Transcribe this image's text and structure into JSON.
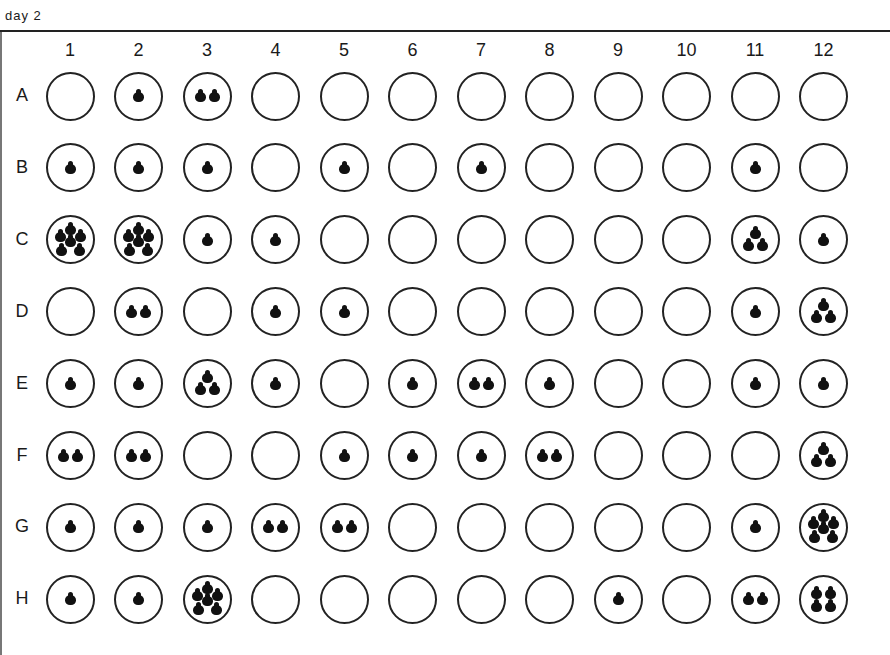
{
  "title": "day 2",
  "plate": {
    "columns": [
      "1",
      "2",
      "3",
      "4",
      "5",
      "6",
      "7",
      "8",
      "9",
      "10",
      "11",
      "12"
    ],
    "rows": [
      "A",
      "B",
      "C",
      "D",
      "E",
      "F",
      "G",
      "H"
    ],
    "colony_counts": {
      "A": [
        0,
        1,
        2,
        0,
        0,
        0,
        0,
        0,
        0,
        0,
        0,
        0
      ],
      "B": [
        1,
        1,
        1,
        0,
        1,
        0,
        1,
        0,
        0,
        0,
        1,
        0
      ],
      "C": [
        6,
        6,
        1,
        1,
        0,
        0,
        0,
        0,
        0,
        0,
        3,
        1
      ],
      "D": [
        0,
        2,
        0,
        1,
        1,
        0,
        0,
        0,
        0,
        0,
        1,
        3
      ],
      "E": [
        1,
        1,
        3,
        1,
        0,
        1,
        2,
        1,
        0,
        0,
        1,
        1
      ],
      "F": [
        2,
        2,
        0,
        0,
        1,
        1,
        1,
        2,
        0,
        0,
        0,
        3
      ],
      "G": [
        1,
        1,
        1,
        2,
        2,
        0,
        0,
        0,
        0,
        0,
        1,
        6
      ],
      "H": [
        1,
        1,
        6,
        0,
        0,
        0,
        0,
        0,
        1,
        0,
        2,
        4
      ]
    }
  },
  "colors": {
    "ink": "#111111",
    "background": "#ffffff"
  }
}
